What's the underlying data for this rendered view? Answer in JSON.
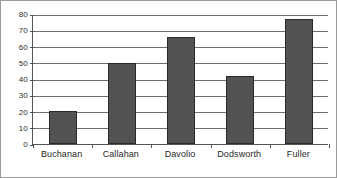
{
  "chart_data": {
    "type": "bar",
    "title": "",
    "subtitle": "",
    "xlabel": "",
    "ylabel": "",
    "categories": [
      "Buchanan",
      "Callahan",
      "Davolio",
      "Dodsworth",
      "Fuller"
    ],
    "values": [
      20,
      50,
      66,
      42,
      77
    ],
    "series": [
      {
        "name": "Series 1",
        "values": [
          20,
          50,
          66,
          42,
          77
        ]
      }
    ],
    "ylim": [
      0,
      80
    ],
    "ytick_step": 10,
    "yticks": [
      0,
      10,
      20,
      30,
      40,
      50,
      60,
      70,
      80
    ],
    "ytick_labels": [
      "0",
      "10",
      "20",
      "30",
      "40",
      "50",
      "60",
      "70",
      "80"
    ],
    "grid": true,
    "grid_axis": "y",
    "legend": false,
    "legend_position": "none",
    "annotations": [],
    "colors": {
      "bar_fill": "#4d4d4d",
      "bar_border": "#2a2a2a",
      "gridline": "#6f6f6f",
      "axis": "#555555",
      "frame": "#9a9a9a",
      "text": "#1f1f1f",
      "background": "#ffffff"
    }
  }
}
